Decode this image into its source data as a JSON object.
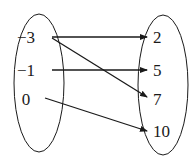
{
  "diagram": {
    "type": "mapping",
    "domain": {
      "elements": [
        {
          "label": "−3",
          "x": 26,
          "y": 43
        },
        {
          "label": "−1",
          "x": 26,
          "y": 76
        },
        {
          "label": "0",
          "x": 26,
          "y": 105
        }
      ]
    },
    "range": {
      "elements": [
        {
          "label": "2",
          "x": 153,
          "y": 43
        },
        {
          "label": "5",
          "x": 153,
          "y": 76
        },
        {
          "label": "7",
          "x": 153,
          "y": 105
        },
        {
          "label": "10",
          "x": 153,
          "y": 137
        }
      ]
    },
    "arrows": [
      {
        "from": "−3",
        "to": "2",
        "x1": 52,
        "y1": 37,
        "x2": 147,
        "y2": 37
      },
      {
        "from": "−3",
        "to": "7",
        "x1": 52,
        "y1": 38,
        "x2": 147,
        "y2": 97
      },
      {
        "from": "−1",
        "to": "5",
        "x1": 52,
        "y1": 70,
        "x2": 147,
        "y2": 70
      },
      {
        "from": "0",
        "to": "10",
        "x1": 45,
        "y1": 98,
        "x2": 147,
        "y2": 131
      }
    ],
    "colors": {
      "stroke": "#1a1a1a",
      "background": "#ffffff"
    }
  }
}
